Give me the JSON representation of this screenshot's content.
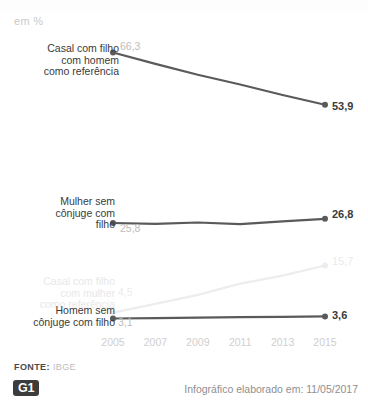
{
  "header": {
    "unit_label": "em %",
    "ghost_title": ""
  },
  "footer": {
    "source_key": "FONTE:",
    "source_value": "IBGE",
    "logo": "G1",
    "credit": "Infográfico elaborado em: 11/05/2017"
  },
  "colors": {
    "line_dark": "#5a5a5a",
    "line_faded": "#ededed",
    "text_dark": "#3a3a3a",
    "text_grey": "#bdbdbd",
    "tick_grey": "#cfcfcf",
    "logo_bg": "#3c3c3c"
  },
  "chart_data": {
    "type": "line",
    "title": "",
    "subtitle": "em %",
    "xlabel": "",
    "ylabel": "",
    "ylim": [
      0,
      70
    ],
    "grid": false,
    "legend_position": "inline-left",
    "x": [
      2005,
      2007,
      2009,
      2011,
      2013,
      2015
    ],
    "tick_labels": [
      "2005",
      "2007",
      "2009",
      "2011",
      "2013",
      "2015"
    ],
    "series": [
      {
        "name": "Casal com filho com homem como referência",
        "label_lines": "Casal com filho\ncom homem\ncomo referência",
        "values": [
          66.3,
          63.6,
          61.0,
          58.7,
          56.2,
          53.9
        ],
        "start_value": "66,3",
        "end_value": "53,9",
        "emphasis": "strong"
      },
      {
        "name": "Mulher sem cônjuge com filho",
        "label_lines": "Mulher sem\ncônjuge com\nfilho",
        "values": [
          25.8,
          25.6,
          25.9,
          25.5,
          26.2,
          26.8
        ],
        "start_value": "25,8",
        "end_value": "26,8",
        "emphasis": "strong"
      },
      {
        "name": "Casal com filho com mulher como referência",
        "label_lines": "Casal com filho\ncom mulher\ncomo referência",
        "values": [
          4.5,
          6.6,
          8.7,
          11.4,
          13.3,
          15.7
        ],
        "start_value": "4,5",
        "end_value": "15,7",
        "emphasis": "faded"
      },
      {
        "name": "Homem sem cônjuge com filho",
        "label_lines": "Homem sem\ncônjuge com filho",
        "values": [
          3.1,
          3.2,
          3.3,
          3.4,
          3.5,
          3.6
        ],
        "start_value": "3,1",
        "end_value": "3,6",
        "emphasis": "strong"
      }
    ]
  }
}
